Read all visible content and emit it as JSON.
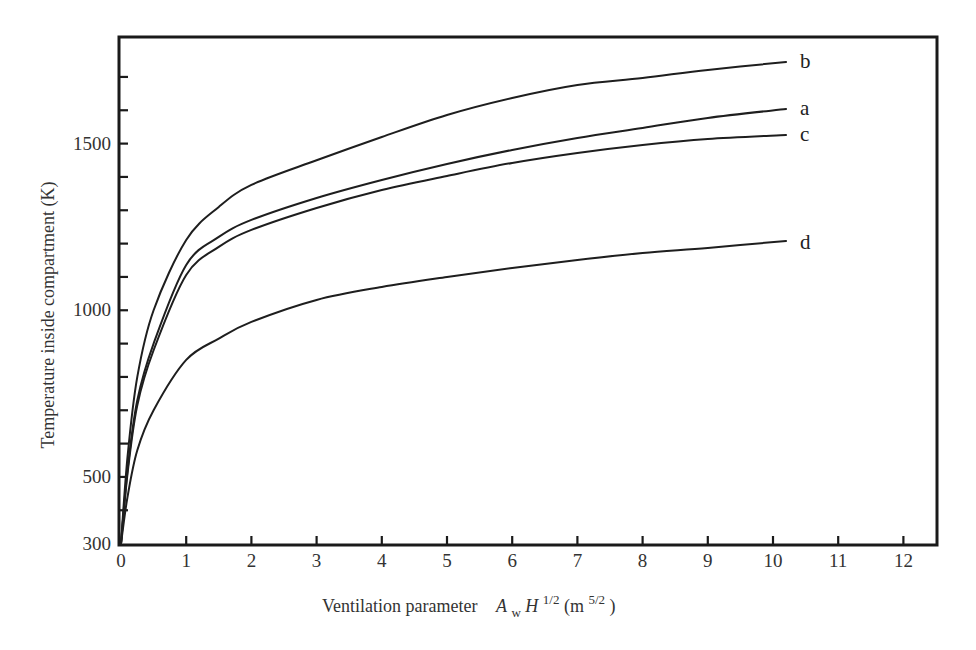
{
  "chart_data": {
    "type": "line",
    "title": "",
    "xlabel": "Ventilation parameter  A_w H^1/2 (m^5/2)",
    "xlabel_parts": {
      "text": "Ventilation parameter",
      "symbol_A": "A",
      "sub_w": "w",
      "symbol_H": "H",
      "sup_half": "1/2",
      "unit_open": " (m",
      "unit_sup": "5/2",
      "unit_close": ")"
    },
    "ylabel": "Temperature inside compartment (K)",
    "xlim": [
      0,
      12.5
    ],
    "ylim": [
      300,
      1820
    ],
    "x_ticks": [
      0,
      1,
      2,
      3,
      4,
      5,
      6,
      7,
      8,
      9,
      10,
      11,
      12
    ],
    "x_tick_labels": [
      "0",
      "1",
      "2",
      "3",
      "4",
      "5",
      "6",
      "7",
      "8",
      "9",
      "10",
      "11",
      "12"
    ],
    "y_ticks_minor": [
      400,
      500,
      600,
      700,
      800,
      900,
      1000,
      1100,
      1200,
      1300,
      1400,
      1500,
      1600,
      1700
    ],
    "y_tick_labels": [
      {
        "value": 300,
        "label": "300"
      },
      {
        "value": 500,
        "label": "500"
      },
      {
        "value": 1000,
        "label": "1000"
      },
      {
        "value": 1500,
        "label": "1500"
      }
    ],
    "grid": false,
    "legend": "inline labels at right end of curves",
    "x": [
      0,
      0.1,
      0.25,
      0.5,
      1,
      1.5,
      2,
      3,
      4,
      5,
      6,
      7,
      8,
      9,
      10.2
    ],
    "series": [
      {
        "name": "b",
        "values": [
          300,
          560,
          800,
          1000,
          1211,
          1310,
          1376,
          1450,
          1520,
          1586,
          1637,
          1676,
          1697,
          1721,
          1745
        ]
      },
      {
        "name": "a",
        "values": [
          300,
          520,
          730,
          900,
          1136,
          1220,
          1271,
          1337,
          1391,
          1439,
          1481,
          1517,
          1547,
          1577,
          1604
        ]
      },
      {
        "name": "c",
        "values": [
          300,
          510,
          715,
          880,
          1106,
          1190,
          1241,
          1307,
          1361,
          1403,
          1442,
          1472,
          1496,
          1514,
          1526
        ]
      },
      {
        "name": "d",
        "values": [
          300,
          440,
          580,
          700,
          851,
          915,
          965,
          1031,
          1070,
          1100,
          1127,
          1151,
          1172,
          1187,
          1208
        ]
      }
    ]
  }
}
